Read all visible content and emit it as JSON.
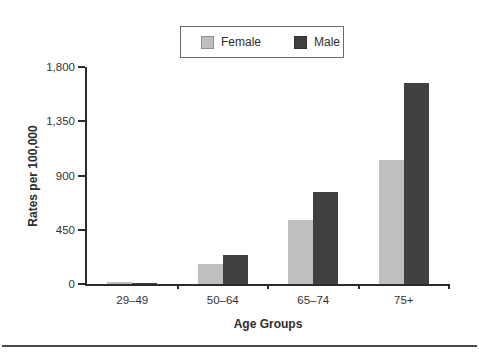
{
  "chart_data": {
    "type": "bar",
    "title": "",
    "categories": [
      "29–49",
      "50–64",
      "65–74",
      "75+"
    ],
    "series": [
      {
        "name": "Female",
        "color": "#bfbfbf",
        "values": [
          15,
          170,
          535,
          1025
        ]
      },
      {
        "name": "Male",
        "color": "#404040",
        "values": [
          5,
          240,
          760,
          1670
        ]
      }
    ],
    "xlabel": "Age Groups",
    "ylabel": "Rates per 100,000",
    "ylim": [
      0,
      1800
    ],
    "yticks": [
      {
        "value": 0,
        "label": "0"
      },
      {
        "value": 450,
        "label": "450"
      },
      {
        "value": 900,
        "label": "900"
      },
      {
        "value": 1350,
        "label": "1,350"
      },
      {
        "value": 1800,
        "label": "1,800"
      }
    ],
    "legend_position": "top-center",
    "grid": false
  },
  "colors": {
    "axis": "#2b2b2b",
    "text": "#333333",
    "female_bar": "#bfbfbf",
    "male_bar": "#404040",
    "separator": "#4a4a4a",
    "background": "#ffffff"
  }
}
